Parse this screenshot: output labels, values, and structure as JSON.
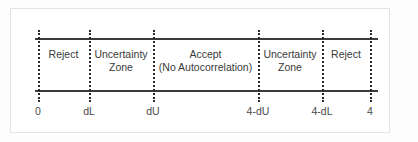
{
  "figure": {
    "frame_color": "#e3e3e3",
    "line_color": "#3b3b3b",
    "text_color": "#3a3a3a",
    "background": "#ffffff"
  },
  "chart_data": {
    "type": "line",
    "xlabel": "",
    "ylabel": "",
    "xlim": [
      0,
      4
    ],
    "grid": false,
    "legend": null,
    "axis_ticks": [
      {
        "label": "0",
        "x_px": 38,
        "value": 0
      },
      {
        "label": "dL",
        "x_px": 89,
        "value": null
      },
      {
        "label": "dU",
        "x_px": 153,
        "value": null
      },
      {
        "label": "4-dU",
        "x_px": 258,
        "value": null
      },
      {
        "label": "4-dL",
        "x_px": 322,
        "value": null
      },
      {
        "label": "4",
        "x_px": 370,
        "value": 4
      }
    ],
    "regions": [
      {
        "line1": "Reject",
        "line2": "",
        "start_label": "0",
        "end_label": "dL",
        "start_px": 38,
        "end_px": 89
      },
      {
        "line1": "Uncertainty",
        "line2": "Zone",
        "start_label": "dL",
        "end_label": "dU",
        "start_px": 89,
        "end_px": 153
      },
      {
        "line1": "Accept",
        "line2": "(No Autocorrelation)",
        "start_label": "dU",
        "end_label": "4-dU",
        "start_px": 153,
        "end_px": 258
      },
      {
        "line1": "Uncertainty",
        "line2": "Zone",
        "start_label": "4-dU",
        "end_label": "4-dL",
        "start_px": 258,
        "end_px": 322
      },
      {
        "line1": "Reject",
        "line2": "",
        "start_label": "4-dL",
        "end_label": "4",
        "start_px": 322,
        "end_px": 370
      }
    ]
  }
}
